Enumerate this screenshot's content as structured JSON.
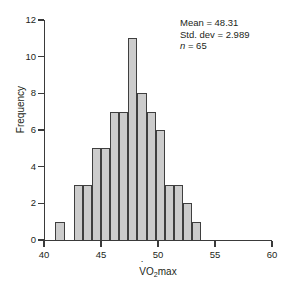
{
  "chart_data": {
    "type": "bar",
    "title": "",
    "xlabel": "VO2max",
    "xlabel_parts": {
      "v": "V",
      "o": "O",
      "sub": "2",
      "tail": "max"
    },
    "ylabel": "Frequency",
    "xlim": [
      40,
      60
    ],
    "ylim": [
      0,
      12
    ],
    "xticks": [
      40,
      45,
      50,
      55,
      60
    ],
    "yticks": [
      0,
      2,
      4,
      6,
      8,
      10,
      12
    ],
    "grid": false,
    "legend": null,
    "bin_width": 0.8,
    "bin_starts": [
      41.0,
      42.6,
      43.4,
      44.2,
      45.0,
      45.8,
      46.6,
      47.4,
      48.2,
      49.0,
      49.8,
      50.6,
      51.4,
      52.2,
      53.0,
      53.8,
      54.6
    ],
    "categories": [
      "41.0",
      "42.6",
      "43.4",
      "44.2",
      "45.0",
      "45.8",
      "46.6",
      "47.4",
      "48.2",
      "49.0",
      "49.8",
      "50.6",
      "51.4",
      "52.2",
      "53.0",
      "53.8",
      "54.6"
    ],
    "values": [
      1,
      0,
      3,
      3,
      5,
      5,
      7,
      7,
      11,
      8,
      7,
      6,
      3,
      3,
      2,
      1,
      0
    ],
    "bars": [
      {
        "x": 41.0,
        "height": 1
      },
      {
        "x": 42.6,
        "height": 3
      },
      {
        "x": 43.4,
        "height": 3
      },
      {
        "x": 44.2,
        "height": 5
      },
      {
        "x": 45.0,
        "height": 5
      },
      {
        "x": 45.8,
        "height": 7
      },
      {
        "x": 46.6,
        "height": 7
      },
      {
        "x": 47.4,
        "height": 11
      },
      {
        "x": 48.2,
        "height": 8
      },
      {
        "x": 49.0,
        "height": 7
      },
      {
        "x": 49.8,
        "height": 6
      },
      {
        "x": 50.6,
        "height": 3
      },
      {
        "x": 51.4,
        "height": 3
      },
      {
        "x": 52.2,
        "height": 2
      },
      {
        "x": 53.0,
        "height": 1
      }
    ],
    "annotations": {
      "mean_label": "Mean = 48.31",
      "stddev_label": "Std. dev = 2.989",
      "n_symbol": "n",
      "n_value": " = 65"
    },
    "colors": {
      "bar_fill": "#cccccc",
      "bar_edge": "#3f3f3f",
      "axis": "#3a3a3a",
      "text": "#231f20",
      "background": "#ffffff"
    }
  }
}
